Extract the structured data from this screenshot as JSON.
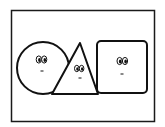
{
  "diagram": {
    "title": "",
    "frame": {
      "x": 11,
      "y": 10,
      "width": 144,
      "height": 112,
      "stroke": "#1a1a1a"
    },
    "shapes": [
      {
        "id": "circle",
        "type": "circle",
        "label": "",
        "cx": 43,
        "cy": 68,
        "r": 26,
        "face": {
          "eye_left": [
            39,
            59
          ],
          "eye_right": [
            44,
            59
          ],
          "mouth": [
            42,
            71
          ]
        }
      },
      {
        "id": "triangle",
        "type": "triangle",
        "label": "",
        "points": [
          [
            80,
            43
          ],
          [
            52,
            94
          ],
          [
            98,
            94
          ]
        ],
        "face": {
          "eye_left": [
            77,
            68
          ],
          "eye_right": [
            81,
            68
          ],
          "mouth": [
            80,
            78
          ]
        }
      },
      {
        "id": "square",
        "type": "square",
        "label": "",
        "x": 97,
        "y": 41,
        "width": 50,
        "height": 52,
        "corner_radius": 4,
        "face": {
          "eye_left": [
            119,
            61
          ],
          "eye_right": [
            125,
            61
          ],
          "mouth": [
            122,
            74
          ]
        }
      }
    ],
    "colors": {
      "stroke": "#111111",
      "fill": "#ffffff",
      "background": "#ffffff"
    }
  }
}
